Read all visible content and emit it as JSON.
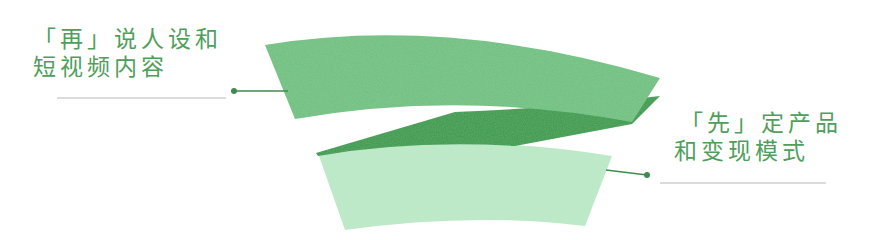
{
  "diagram": {
    "colors": {
      "top_ribbon": "#6cc07e",
      "fold": "#2e9a45",
      "bottom_ribbon": "#b9e8c5",
      "text": "#4f9e5c",
      "connector": "#3f8a4e",
      "underline": "#b8b8b8"
    },
    "labels": [
      {
        "id": "left",
        "lines": [
          "「再」说人设和",
          "短视频内容"
        ],
        "points_to": "top_ribbon"
      },
      {
        "id": "right",
        "lines": [
          "「先」定产品",
          "和变现模式"
        ],
        "points_to": "bottom_ribbon"
      }
    ]
  }
}
